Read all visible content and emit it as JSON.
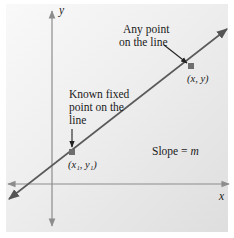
{
  "diagram": {
    "axes": {
      "x_label": "x",
      "y_label": "y"
    },
    "annotations": {
      "any_point_line1": "Any point",
      "any_point_line2": "on the line",
      "known_point_line1": "Known fixed",
      "known_point_line2": "point on the",
      "known_point_line3": "line",
      "slope_text": "Slope = ",
      "slope_var": "m"
    },
    "points": [
      {
        "name": "known-point",
        "label": "(x₁, y₁)",
        "px": [
          72,
          152
        ]
      },
      {
        "name": "any-point",
        "label": "(x, y)",
        "px": [
          191,
          66
        ]
      }
    ],
    "colors": {
      "line": "#5a5a5a",
      "axis": "#8c8c8c",
      "point": "#6e6e6e",
      "panel_light": "#f9f9f9",
      "panel_dark": "#dedede"
    }
  }
}
